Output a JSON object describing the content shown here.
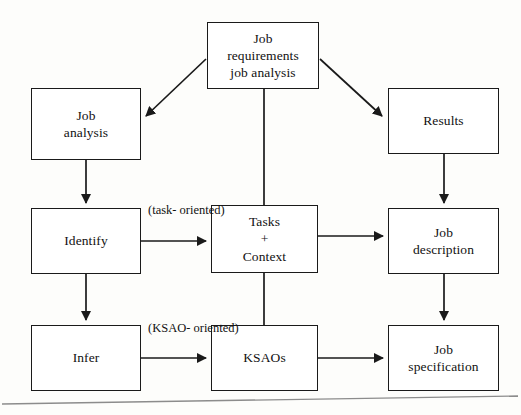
{
  "diagram": {
    "type": "flowchart",
    "background_color": "#fdfdfb",
    "line_color": "#1a1a1a",
    "text_color": "#111111",
    "nodes": [
      {
        "id": "top",
        "lines": [
          "Job",
          "requirements",
          "job analysis"
        ]
      },
      {
        "id": "jobanalysis",
        "lines": [
          "Job",
          "analysis"
        ]
      },
      {
        "id": "results",
        "lines": [
          "Results"
        ]
      },
      {
        "id": "identify",
        "lines": [
          "Identify"
        ]
      },
      {
        "id": "tasks",
        "lines": [
          "Tasks",
          "+",
          "Context"
        ]
      },
      {
        "id": "jobdesc",
        "lines": [
          "Job",
          "description"
        ]
      },
      {
        "id": "infer",
        "lines": [
          "Infer"
        ]
      },
      {
        "id": "ksaos",
        "lines": [
          "KSAOs"
        ]
      },
      {
        "id": "jobspec",
        "lines": [
          "Job",
          "specification"
        ]
      }
    ],
    "edge_labels": [
      {
        "id": "task-oriented",
        "lines": [
          "(task-",
          "oriented)"
        ]
      },
      {
        "id": "ksao-oriented",
        "lines": [
          "(KSAO-",
          "oriented)"
        ]
      }
    ],
    "edges": [
      {
        "from": "top",
        "to": "jobanalysis",
        "arrow": true
      },
      {
        "from": "top",
        "to": "results",
        "arrow": true
      },
      {
        "from": "top",
        "to": "tasks",
        "arrow": false
      },
      {
        "from": "jobanalysis",
        "to": "identify",
        "arrow": true
      },
      {
        "from": "results",
        "to": "jobdesc",
        "arrow": true
      },
      {
        "from": "identify",
        "to": "tasks",
        "arrow": true,
        "label": "task-oriented"
      },
      {
        "from": "identify",
        "to": "infer",
        "arrow": true
      },
      {
        "from": "tasks",
        "to": "jobdesc",
        "arrow": true
      },
      {
        "from": "tasks",
        "to": "ksaos",
        "arrow": false
      },
      {
        "from": "infer",
        "to": "ksaos",
        "arrow": true,
        "label": "ksao-oriented"
      },
      {
        "from": "ksaos",
        "to": "jobspec",
        "arrow": true
      },
      {
        "from": "jobdesc",
        "to": "jobspec",
        "arrow": true
      }
    ]
  }
}
